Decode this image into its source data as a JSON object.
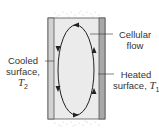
{
  "diagram": {
    "labels": {
      "cooled_line1": "Cooled",
      "cooled_line2": "surface,",
      "cooled_symbol": "T",
      "cooled_sub": "2",
      "flow_line1": "Cellular",
      "flow_line2": "flow",
      "heated_line1": "Heated",
      "heated_line2": "surface,",
      "heated_symbol": "T",
      "heated_sub": "1"
    },
    "colors": {
      "interior": "#ebebeb",
      "cooled_plate": "#d2d2d2",
      "heated_plate": "#a8a8a8",
      "outline": "#555555",
      "flow_line": "#222222"
    },
    "flow_direction": "counterclockwise: down along cooled wall, up along heated wall"
  }
}
